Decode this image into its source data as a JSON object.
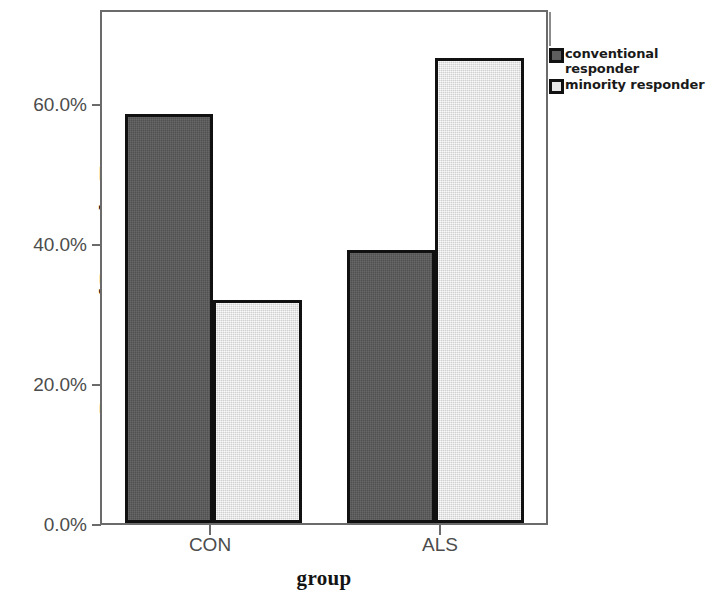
{
  "chart_data": {
    "type": "bar",
    "title": "",
    "subtitle": "",
    "xlabel": "group",
    "ylabel": "Percentage of Responder Type",
    "categories": [
      "CON",
      "ALS"
    ],
    "series": [
      {
        "name": "conventional responder",
        "values": [
          60.0,
          40.0
        ],
        "color": "#595959"
      },
      {
        "name": "minority responder",
        "values": [
          32.7,
          68.3
        ],
        "color": "#e3e3e3"
      }
    ],
    "ylim": [
      0,
      75
    ],
    "y_ticks": [
      0,
      20,
      40,
      60
    ],
    "y_tick_labels": [
      "0.0%",
      "20.0%",
      "40.0%",
      "60.0%"
    ],
    "grid": false,
    "legend_position": "right",
    "bar_border_color": "#111111",
    "frame_color": "#6b6b6b"
  },
  "axes": {
    "y_title": "Percentage of Responder Type",
    "x_title": "group",
    "y_tick_labels": [
      "60.0%",
      "40.0%",
      "20.0%",
      "0.0%"
    ],
    "x_tick_labels": [
      "CON",
      "ALS"
    ]
  },
  "legend": {
    "entries": [
      {
        "label_line1": "conventional",
        "label_line2": "responder",
        "swatch": "dark-gray-swatch"
      },
      {
        "label_line1": "minority responder",
        "label_line2": "",
        "swatch": "light-gray-swatch"
      }
    ]
  }
}
